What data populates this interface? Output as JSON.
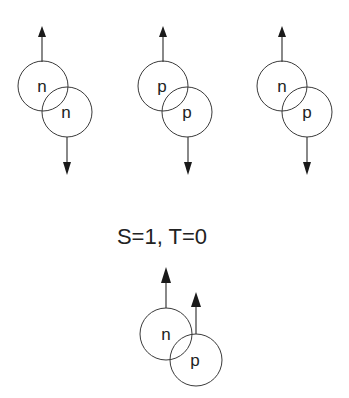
{
  "diagrams": [
    {
      "top": "n",
      "bottom": "n",
      "top_spin": "up",
      "bottom_spin": "down"
    },
    {
      "top": "p",
      "bottom": "p",
      "top_spin": "up",
      "bottom_spin": "down"
    },
    {
      "top": "n",
      "bottom": "p",
      "top_spin": "up",
      "bottom_spin": "down"
    }
  ],
  "caption": "S=1, T=0",
  "bottom_diagram": {
    "left": "n",
    "right": "p",
    "left_spin": "up",
    "right_spin": "up"
  }
}
